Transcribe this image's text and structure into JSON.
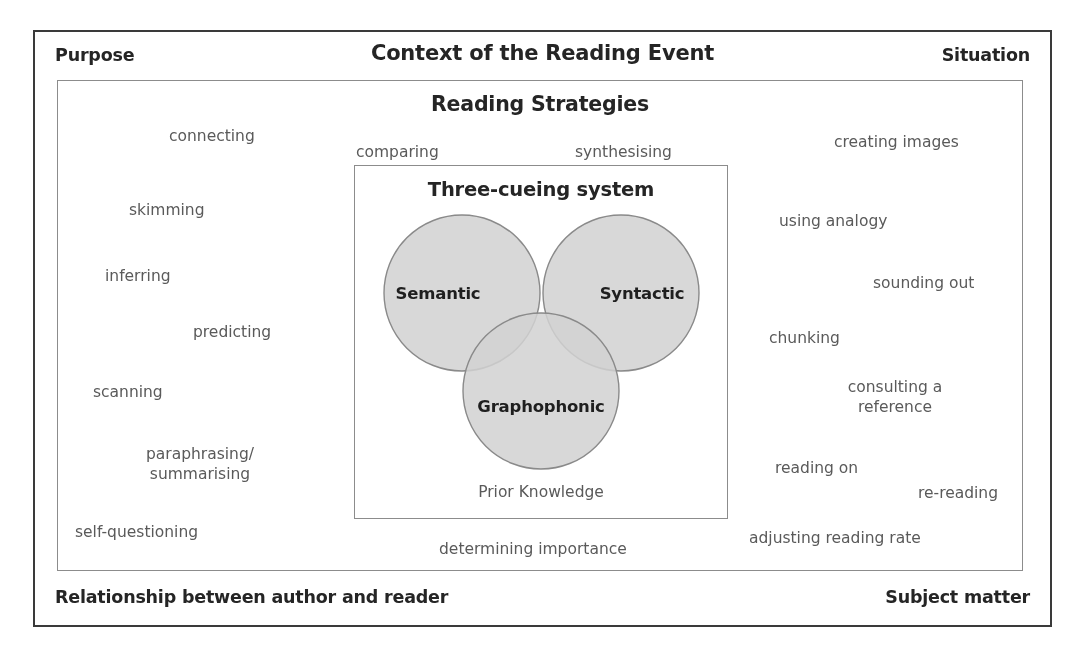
{
  "frame": {
    "header": {
      "left_label": "Purpose",
      "center_title": "Context of the Reading Event",
      "right_label": "Situation"
    },
    "footer": {
      "left_label": "Relationship between author and reader",
      "right_label": "Subject matter"
    }
  },
  "strategies": {
    "title": "Reading Strategies",
    "words": [
      {
        "text": "connecting",
        "x": 168,
        "y": 125,
        "align": "left"
      },
      {
        "text": "comparing",
        "x": 355,
        "y": 141,
        "align": "left"
      },
      {
        "text": "synthesising",
        "x": 574,
        "y": 141,
        "align": "left"
      },
      {
        "text": "creating images",
        "x": 833,
        "y": 131,
        "align": "left"
      },
      {
        "text": "skimming",
        "x": 128,
        "y": 199,
        "align": "left"
      },
      {
        "text": "using analogy",
        "x": 778,
        "y": 210,
        "align": "left"
      },
      {
        "text": "inferring",
        "x": 104,
        "y": 265,
        "align": "left"
      },
      {
        "text": "sounding out",
        "x": 872,
        "y": 272,
        "align": "left"
      },
      {
        "text": "predicting",
        "x": 192,
        "y": 321,
        "align": "left"
      },
      {
        "text": "chunking",
        "x": 768,
        "y": 327,
        "align": "left"
      },
      {
        "text": "scanning",
        "x": 92,
        "y": 381,
        "align": "left"
      },
      {
        "text": "consulting a\nreference",
        "x": 894,
        "y": 376,
        "align": "center"
      },
      {
        "text": "paraphrasing/\nsummarising",
        "x": 199,
        "y": 443,
        "align": "center"
      },
      {
        "text": "reading on",
        "x": 774,
        "y": 457,
        "align": "left"
      },
      {
        "text": "re-reading",
        "x": 917,
        "y": 482,
        "align": "left"
      },
      {
        "text": "self-questioning",
        "x": 74,
        "y": 521,
        "align": "left"
      },
      {
        "text": "adjusting reading rate",
        "x": 748,
        "y": 527,
        "align": "left"
      },
      {
        "text": "determining importance",
        "x": 438,
        "y": 538,
        "align": "left"
      }
    ]
  },
  "cueing": {
    "title": "Three-cueing system",
    "footer_label": "Prior Knowledge",
    "circles": [
      {
        "label": "Semantic",
        "cx": 107,
        "cy": 127,
        "r": 78
      },
      {
        "label": "Syntactic",
        "cx": 266,
        "cy": 127,
        "r": 78
      },
      {
        "label": "Graphophonic",
        "cx": 186,
        "cy": 225,
        "r": 78
      }
    ],
    "label_positions": [
      {
        "label": "Semantic",
        "x": 83,
        "y": 127
      },
      {
        "label": "Syntactic",
        "x": 287,
        "y": 127
      },
      {
        "label": "Graphophonic",
        "x": 186,
        "y": 240
      }
    ]
  },
  "colors": {
    "circle_fill": "#d2d2d2",
    "circle_stroke": "#8a8a8a",
    "outer_border": "#3a3a3a",
    "inner_border": "#8c8c8c",
    "heading_text": "#252525",
    "body_text": "#5a5a5a",
    "page_background": "#ffffff"
  }
}
